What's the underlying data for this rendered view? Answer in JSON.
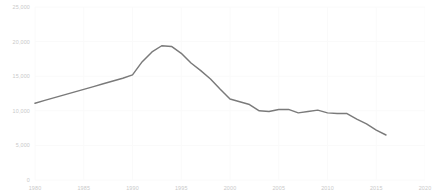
{
  "chart_data": {
    "type": "line",
    "title": "",
    "subtitle": "",
    "xlabel": "",
    "ylabel": "",
    "grid": true,
    "legend": false,
    "legend_position": "none",
    "line_color": "#7a7a7a",
    "background_color": "#ffffff",
    "gridline_color": "#fafafa",
    "tick_label_color": "#c9c9c9",
    "xlim": [
      1980,
      2020
    ],
    "ylim": [
      0,
      25000
    ],
    "xticks": [
      1980,
      1985,
      1990,
      1995,
      2000,
      2005,
      2010,
      2015,
      2020
    ],
    "xtick_labels": [
      "1980",
      "1985",
      "1990",
      "1995",
      "2000",
      "2005",
      "2010",
      "2015",
      "2020"
    ],
    "yticks": [
      0,
      5000,
      10000,
      15000,
      20000,
      25000
    ],
    "ytick_labels": [
      "0",
      "5,000",
      "10,000",
      "15,000",
      "20,000",
      "25,000"
    ],
    "series": [
      {
        "name": "",
        "x": [
          1980,
          1981,
          1982,
          1983,
          1984,
          1985,
          1986,
          1987,
          1988,
          1989,
          1990,
          1991,
          1992,
          1993,
          1994,
          1995,
          1996,
          1997,
          1998,
          1999,
          2000,
          2001,
          2002,
          2003,
          2004,
          2005,
          2006,
          2007,
          2008,
          2009,
          2010,
          2011,
          2012,
          2013,
          2014,
          2015,
          2016
        ],
        "y": [
          11100,
          11500,
          11900,
          12300,
          12700,
          13100,
          13500,
          13900,
          14300,
          14700,
          15200,
          17100,
          18500,
          19400,
          19300,
          18300,
          16900,
          15800,
          14600,
          13100,
          11700,
          11300,
          10900,
          10000,
          9900,
          10200,
          10200,
          9700,
          9900,
          10100,
          9700,
          9600,
          9600,
          8800,
          8100,
          7200,
          6500
        ]
      }
    ]
  }
}
